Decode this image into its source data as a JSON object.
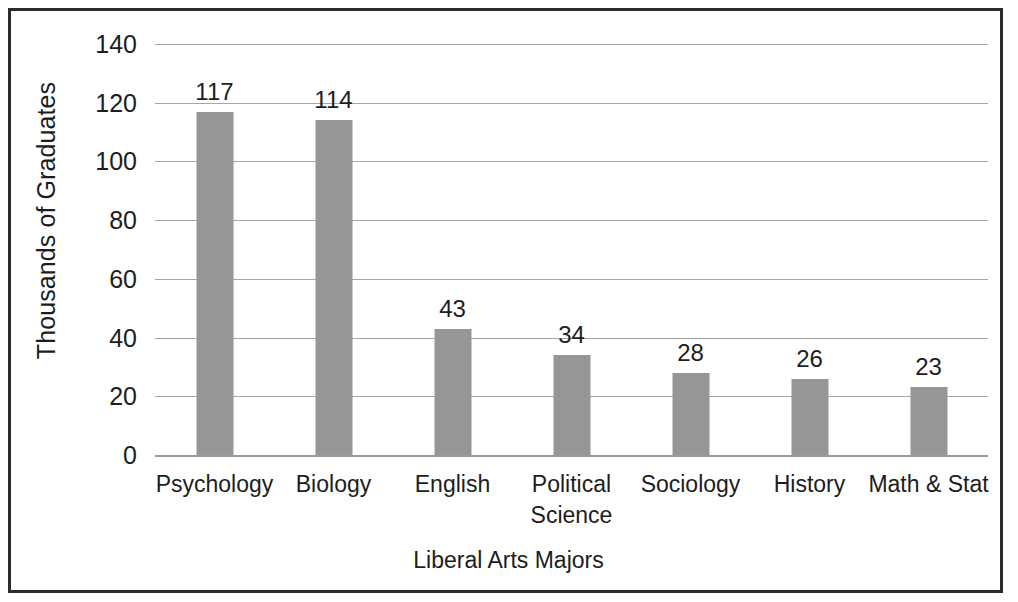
{
  "chart_data": {
    "type": "bar",
    "title": "",
    "subtitle": "",
    "xlabel": "Liberal Arts Majors",
    "ylabel": "Thousands of Graduates",
    "categories": [
      "Psychology",
      "Biology",
      "English",
      "Political Science",
      "Sociology",
      "History",
      "Math & Stat"
    ],
    "values": [
      117,
      114,
      43,
      34,
      28,
      26,
      23
    ],
    "data_labels": [
      "117",
      "114",
      "43",
      "34",
      "28",
      "26",
      "23"
    ],
    "ylim": [
      0,
      140
    ],
    "ytick_step": 20,
    "ytick_labels": [
      "140",
      "120",
      "100",
      "80",
      "60",
      "40",
      "20",
      "0"
    ],
    "ytick_values": [
      140,
      120,
      100,
      80,
      60,
      40,
      20,
      0
    ],
    "grid": "horizontal",
    "legend": "none",
    "bar_color": "#969696",
    "gridline_color": "#a6a6a6",
    "text_color": "#1d1d1d",
    "frame_color": "#2b2b2b",
    "background_color": "#ffffff"
  }
}
